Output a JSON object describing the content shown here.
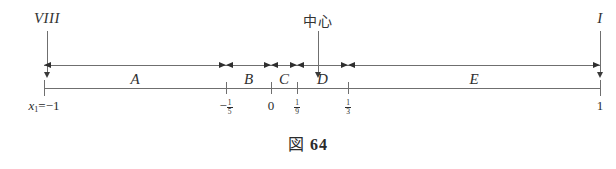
{
  "figure": {
    "caption_symbol": "図",
    "caption_number": "64",
    "callouts": [
      {
        "id": "left",
        "label": "VIII",
        "x": 47,
        "script": "latin"
      },
      {
        "id": "center",
        "label": "中心",
        "x": 318,
        "script": "cjk"
      },
      {
        "id": "right",
        "label": "I",
        "x": 600,
        "script": "latin"
      }
    ],
    "axis": {
      "x_start": 44,
      "x_end": 600,
      "domain_min": -1,
      "domain_max": 1,
      "ticks": [
        {
          "x": 44,
          "value": -1,
          "label_kind": "expression",
          "label": "x₁=−1"
        },
        {
          "x": 226,
          "value": -0.2,
          "label_kind": "fraction",
          "sign": "−",
          "numerator": "1",
          "denominator": "5"
        },
        {
          "x": 271,
          "value": 0,
          "label_kind": "plain",
          "label": "0"
        },
        {
          "x": 297,
          "value": 0.111,
          "label_kind": "fraction",
          "sign": "",
          "numerator": "1",
          "denominator": "9"
        },
        {
          "x": 348,
          "value": 0.333,
          "label_kind": "fraction",
          "sign": "",
          "numerator": "1",
          "denominator": "3"
        },
        {
          "x": 600,
          "value": 1,
          "label_kind": "plain",
          "label": "1"
        }
      ]
    },
    "segments": [
      {
        "label": "A",
        "from_x": 44,
        "to_x": 226,
        "from_value": -1,
        "to_value": -0.2
      },
      {
        "label": "B",
        "from_x": 226,
        "to_x": 271,
        "from_value": -0.2,
        "to_value": 0
      },
      {
        "label": "C",
        "from_x": 271,
        "to_x": 297,
        "from_value": 0,
        "to_value": 0.111
      },
      {
        "label": "D",
        "from_x": 297,
        "to_x": 348,
        "from_value": 0.111,
        "to_value": 0.333
      },
      {
        "label": "E",
        "from_x": 348,
        "to_x": 600,
        "from_value": 0.333,
        "to_value": 1
      }
    ],
    "colors": {
      "ink": "#2b2b2b",
      "rule": "#6f6f6f",
      "arrowhead": "#2e2e2e",
      "background": "#ffffff"
    }
  }
}
